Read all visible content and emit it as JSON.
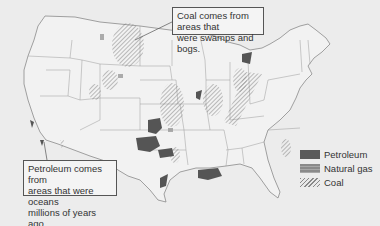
{
  "map": {
    "subject": "United States fossil fuel deposits",
    "callouts": {
      "coal": {
        "line1": "Coal comes from areas that",
        "line2": "were swamps and bogs."
      },
      "petroleum": {
        "line1": "Petroleum comes from",
        "line2": "areas that were oceans",
        "line3": "millions of years ago."
      }
    },
    "legend": [
      {
        "label": "Petroleum",
        "pattern": "solid-dark",
        "color": "#5a5a5a"
      },
      {
        "label": "Natural gas",
        "pattern": "medium-gray",
        "color": "#8a8a8a"
      },
      {
        "label": "Coal",
        "pattern": "diagonal-hatch",
        "color": "#888888"
      }
    ]
  }
}
